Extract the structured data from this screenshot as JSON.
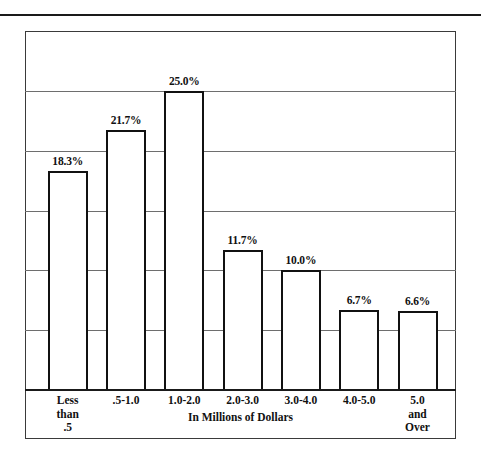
{
  "chart_data": {
    "type": "bar",
    "title": "",
    "xlabel": "In Millions of Dollars",
    "ylabel": "",
    "categories": [
      "Less\nthan\n.5",
      ".5-1.0",
      "1.0-2.0",
      "2.0-3.0",
      "3.0-4.0",
      "4.0-5.0",
      "5.0\nand\nOver"
    ],
    "values": [
      18.3,
      21.7,
      25.0,
      11.7,
      10.0,
      6.7,
      6.6
    ],
    "value_labels": [
      "18.3%",
      "21.7%",
      "25.0%",
      "11.7%",
      "10.0%",
      "6.7%",
      "6.6%"
    ],
    "ylim": [
      0,
      30
    ],
    "grid": true,
    "gridlines_values": [
      25.0,
      20.0,
      15.0,
      10.0,
      5.0
    ],
    "legend": "none",
    "colors": {
      "bar_fill": "#ffffff",
      "bar_outline": "#111111",
      "gridline": "#6e6e6e",
      "axis": "#1a1a1a",
      "frame": "#3a3a3a",
      "text": "#111111"
    }
  }
}
